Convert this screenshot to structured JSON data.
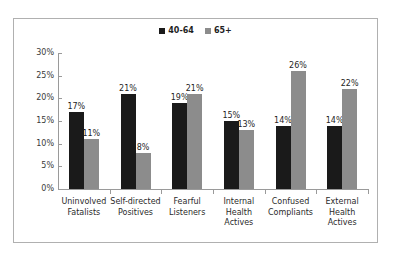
{
  "chart_data": {
    "type": "bar",
    "title": "",
    "subtitle": "",
    "xlabel": "",
    "ylabel": "",
    "ylim": [
      0,
      30
    ],
    "ytick_values": [
      0,
      5,
      10,
      15,
      20,
      25,
      30
    ],
    "ytick_labels": [
      "0%",
      "5%",
      "10%",
      "15%",
      "20%",
      "25%",
      "30%"
    ],
    "grid": false,
    "legend_position": "top-center",
    "categories": [
      "Uninvolved\nFatalists",
      "Self-directed\nPositives",
      "Fearful\nListeners",
      "Internal\nHealth\nActives",
      "Confused\nCompliants",
      "External\nHealth\nActives"
    ],
    "series": [
      {
        "name": "40-64",
        "color": "#1a1a1a",
        "values": [
          17,
          21,
          19,
          15,
          14,
          14
        ],
        "labels": [
          "17%",
          "21%",
          "19%",
          "15%",
          "14%",
          "14%"
        ]
      },
      {
        "name": "65+",
        "color": "#8c8c8c",
        "values": [
          11,
          8,
          21,
          13,
          26,
          22
        ],
        "labels": [
          "11%",
          "8%",
          "21%",
          "13%",
          "26%",
          "22%"
        ]
      }
    ]
  }
}
